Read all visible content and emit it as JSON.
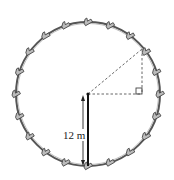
{
  "diagram": {
    "height_label": "12 m",
    "colors": {
      "wheel": "#555555",
      "car": "#555555",
      "dashed": "#666666",
      "pole": "#111111",
      "background": "#ffffff"
    },
    "wheel": {
      "cx": 88,
      "cy": 94,
      "r": 72,
      "car_count": 20
    },
    "annotations": {
      "right_angle_marker": true,
      "dashed_radius_to_car": true,
      "dashed_horizontal_from_hub": true,
      "dashed_vertical_from_car": true,
      "arrow_height": "12 m"
    }
  }
}
